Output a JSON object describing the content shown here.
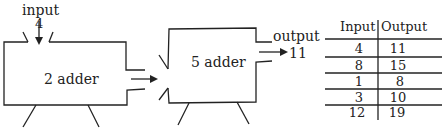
{
  "machine1": {
    "input_label": "input",
    "input_value": "4",
    "label": "2 adder"
  },
  "machine2": {
    "label": "5 adder",
    "output_label": "output",
    "output_value": "11"
  },
  "table": {
    "headers": [
      "Input",
      "Output"
    ],
    "rows": [
      [
        "4",
        "11"
      ],
      [
        "8",
        "15"
      ],
      [
        "1",
        "8"
      ],
      [
        "3",
        "10"
      ],
      [
        "12",
        "19"
      ]
    ]
  },
  "colors": {
    "ink": "#222222",
    "background": "#ffffff"
  }
}
